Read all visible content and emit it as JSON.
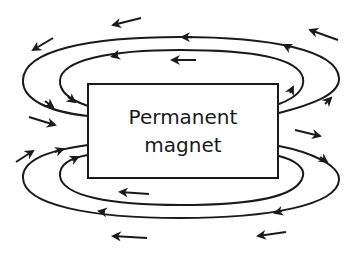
{
  "diagram": {
    "magnet": {
      "label_line1": "Permanent",
      "label_line2": "magnet"
    },
    "colors": {
      "stroke": "#1a1a1a",
      "background": "#ffffff"
    },
    "field_lines": [
      {
        "id": "top-outer",
        "direction": "from right end over the top to left end"
      },
      {
        "id": "top-inner",
        "direction": "from right end over the top to left end"
      },
      {
        "id": "bottom-outer",
        "direction": "from right end under the bottom to left end"
      },
      {
        "id": "bottom-inner",
        "direction": "from right end under the bottom to left end"
      }
    ],
    "free_arrows_count": 11
  }
}
